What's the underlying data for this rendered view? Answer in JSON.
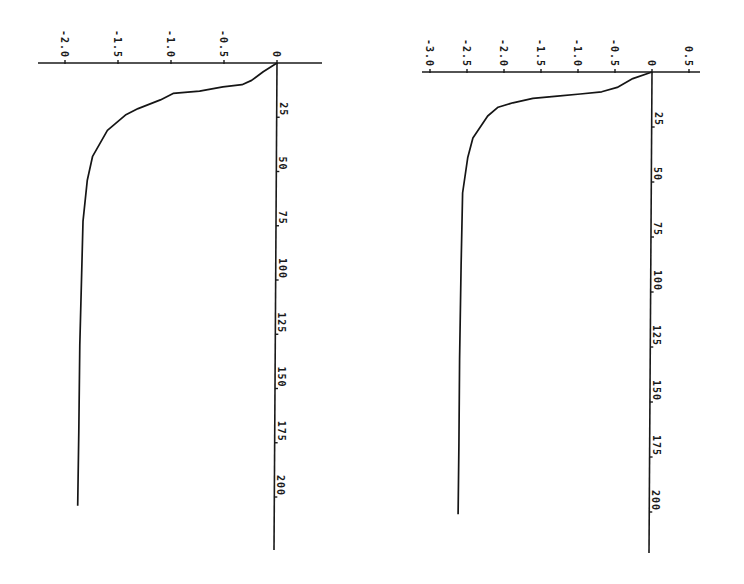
{
  "chart_data": [
    {
      "type": "line",
      "title": "",
      "orientation": "rotated-90-clockwise",
      "xlabel": "",
      "ylabel": "",
      "index_axis": {
        "ticks": [
          25,
          50,
          75,
          100,
          125,
          150,
          175,
          200
        ],
        "tick_labels": [
          "25",
          "50",
          "75",
          "100",
          "125",
          "150",
          "175",
          "200"
        ],
        "range": [
          0,
          225
        ]
      },
      "value_axis": {
        "ticks": [
          -2.0,
          -1.5,
          -1.0,
          -0.5,
          0
        ],
        "tick_labels": [
          "-2.0",
          "-1.5",
          "-1.0",
          "-0.5",
          "0"
        ],
        "range": [
          -2.2,
          0.45
        ]
      },
      "grid": false,
      "legend": null,
      "series": [
        {
          "name": "left",
          "x": [
            0,
            4,
            8,
            10,
            11,
            13,
            14,
            17,
            21,
            24,
            31,
            43,
            54,
            73,
            91,
            130,
            170,
            204
          ],
          "values": [
            0,
            -0.13,
            -0.24,
            -0.33,
            -0.51,
            -0.73,
            -0.98,
            -1.1,
            -1.31,
            -1.43,
            -1.6,
            -1.74,
            -1.79,
            -1.83,
            -1.84,
            -1.86,
            -1.87,
            -1.88
          ]
        }
      ]
    },
    {
      "type": "line",
      "title": "",
      "orientation": "rotated-90-clockwise",
      "xlabel": "",
      "ylabel": "",
      "index_axis": {
        "ticks": [
          25,
          50,
          75,
          100,
          125,
          150,
          175,
          200
        ],
        "tick_labels": [
          "25",
          "50",
          "75",
          "100",
          "125",
          "150",
          "175",
          "200"
        ],
        "range": [
          0,
          220
        ]
      },
      "value_axis": {
        "ticks": [
          -3.0,
          -2.5,
          -2.0,
          -1.5,
          -1.0,
          -0.5,
          0,
          0.5
        ],
        "tick_labels": [
          "-3.0",
          "-2.5",
          "-2.0",
          "-1.5",
          "-1.0",
          "-0.5",
          "0",
          "0.5"
        ],
        "range": [
          -3.05,
          0.65
        ]
      },
      "grid": false,
      "legend": null,
      "series": [
        {
          "name": "right",
          "x": [
            0,
            3,
            7,
            9,
            10,
            11,
            12,
            14,
            16,
            20,
            25,
            30,
            39,
            55,
            88,
            130,
            170,
            201
          ],
          "values": [
            0,
            -0.26,
            -0.47,
            -0.68,
            -0.97,
            -1.28,
            -1.61,
            -1.88,
            -2.08,
            -2.22,
            -2.32,
            -2.42,
            -2.49,
            -2.56,
            -2.58,
            -2.6,
            -2.61,
            -2.62
          ]
        }
      ]
    }
  ],
  "layout": {
    "charts": [
      {
        "origin_px": [
          277,
          63
        ],
        "px_per_value": 106,
        "px_per_index": 2.17,
        "value_axis_px": [
          38,
          322
        ],
        "index_axis_end_px": 550
      },
      {
        "origin_px": [
          652,
          72
        ],
        "px_per_value": 74,
        "px_per_index": 2.2,
        "value_axis_px": [
          422,
          700
        ],
        "index_axis_end_px": 553
      }
    ]
  }
}
